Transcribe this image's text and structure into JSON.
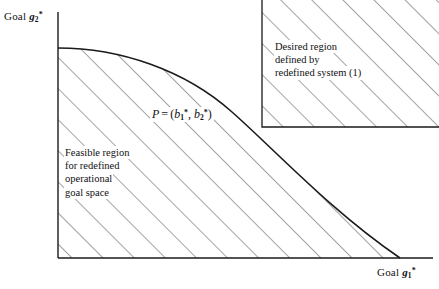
{
  "figure": {
    "width": 439,
    "height": 289,
    "background_color": "#ffffff",
    "line_color": "#1a1a1a",
    "hatch_color": "#555555"
  },
  "axes": {
    "y": {
      "label_prefix": "Goal",
      "variable": "g",
      "subscript": "2",
      "superscript": "*",
      "full_label": "Goal g2*",
      "axis_x_px": 58,
      "axis_top_px": 12,
      "axis_bottom_px": 258
    },
    "x": {
      "label_prefix": "Goal",
      "variable": "g",
      "subscript": "1",
      "superscript": "*",
      "full_label": "Goal g1*",
      "axis_y_px": 258,
      "axis_left_px": 58,
      "axis_right_px": 433
    }
  },
  "frontier": {
    "description": "concave efficient frontier curve",
    "start_point": [
      58,
      48
    ],
    "end_point": [
      400,
      258
    ],
    "passes_through_point_p": true
  },
  "point_p": {
    "name": "P",
    "equals": "=",
    "open_paren": "(",
    "coord1_var": "b",
    "coord1_sub": "1",
    "coord1_sup": "*",
    "comma": ",",
    "coord2_var": "b",
    "coord2_sub": "2",
    "coord2_sup": "*",
    "close_paren": ")",
    "full_label": "P = (b1*, b2*)",
    "position_px": [
      262,
      127
    ]
  },
  "desired_region": {
    "annotation_lines": [
      "Desired region",
      "defined by",
      "redefined system (1)"
    ],
    "box": {
      "left_px": 262,
      "top_px": 0,
      "right_px": 439,
      "bottom_px": 127
    },
    "hatch_direction": "forward-slash"
  },
  "feasible_region": {
    "annotation_lines": [
      "Feasible region",
      "for redefined",
      "operational",
      "goal space"
    ],
    "hatch_direction": "forward-slash"
  }
}
